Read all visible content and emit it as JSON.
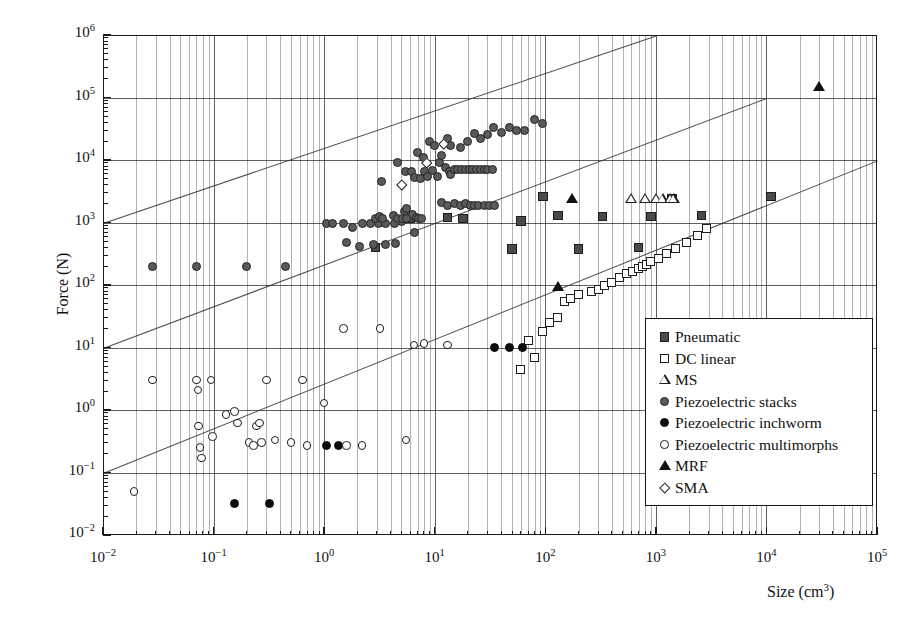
{
  "chart_data": {
    "type": "scatter",
    "title": "",
    "xlabel": "Size (cm3)",
    "ylabel": "Force (N)",
    "xscale": "log",
    "yscale": "log",
    "xlim": [
      0.01,
      100000
    ],
    "ylim": [
      0.01,
      1000000
    ],
    "grid": true,
    "legend_position": "bottom-right",
    "x_tick_labels": [
      "10-2",
      "10-1",
      "100",
      "101",
      "102",
      "103",
      "104",
      "105"
    ],
    "y_tick_labels": [
      "10-2",
      "10-1",
      "100",
      "101",
      "102",
      "103",
      "104",
      "105",
      "106"
    ],
    "x_tick_exponents": [
      "-2",
      "-1",
      "0",
      "1",
      "2",
      "3",
      "4",
      "5"
    ],
    "y_tick_exponents": [
      "-2",
      "-1",
      "0",
      "1",
      "2",
      "3",
      "4",
      "5",
      "6"
    ],
    "reference_lines": [
      {
        "name": "upper-diagonal",
        "slope": 0.666,
        "points": [
          [
            0.01,
            1000
          ],
          [
            1000,
            1000000
          ]
        ]
      },
      {
        "name": "middle-diagonal",
        "slope": 0.666,
        "points": [
          [
            0.01,
            10
          ],
          [
            10000,
            100000
          ]
        ]
      },
      {
        "name": "lower-diagonal",
        "slope": 0.666,
        "points": [
          [
            0.01,
            0.1
          ],
          [
            100000,
            10000
          ]
        ]
      }
    ],
    "series": [
      {
        "name": "Pneumatic",
        "marker": "square-filled",
        "color": "#4a4a4a",
        "points": [
          [
            2.9,
            400
          ],
          [
            6.0,
            1150
          ],
          [
            13.0,
            1200
          ],
          [
            18.0,
            1150
          ],
          [
            50.0,
            380
          ],
          [
            60.0,
            1050
          ],
          [
            95.0,
            2600
          ],
          [
            130.0,
            1300
          ],
          [
            200.0,
            380
          ],
          [
            330.0,
            1250
          ],
          [
            700.0,
            400
          ],
          [
            900.0,
            1250
          ],
          [
            1400.0,
            2400
          ],
          [
            2600.0,
            1300
          ],
          [
            11000.0,
            2600
          ]
        ]
      },
      {
        "name": "DC linear",
        "marker": "square-open",
        "color": "#ffffff",
        "points": [
          [
            60.0,
            4.5
          ],
          [
            70.0,
            13.0
          ],
          [
            80.0,
            7.0
          ],
          [
            95.0,
            18.0
          ],
          [
            110.0,
            25.0
          ],
          [
            130.0,
            30.0
          ],
          [
            150.0,
            55.0
          ],
          [
            170.0,
            60.0
          ],
          [
            200.0,
            70.0
          ],
          [
            260.0,
            80.0
          ],
          [
            300.0,
            85.0
          ],
          [
            340.0,
            100.0
          ],
          [
            400.0,
            110.0
          ],
          [
            470.0,
            130.0
          ],
          [
            540.0,
            150.0
          ],
          [
            620.0,
            165.0
          ],
          [
            700.0,
            185.0
          ],
          [
            760.0,
            200.0
          ],
          [
            820.0,
            210.0
          ],
          [
            900.0,
            240.0
          ],
          [
            1050.0,
            270.0
          ],
          [
            1250.0,
            320.0
          ],
          [
            1500.0,
            380.0
          ],
          [
            1900.0,
            480.0
          ],
          [
            2400.0,
            620.0
          ],
          [
            2900.0,
            800.0
          ]
        ]
      },
      {
        "name": "MS",
        "marker": "triangle-open",
        "color": "#ffffff",
        "points": [
          [
            600.0,
            2400
          ],
          [
            800.0,
            2400
          ],
          [
            1000.0,
            2400
          ],
          [
            1150.0,
            2400
          ],
          [
            1350.0,
            2400
          ],
          [
            1450.0,
            2400
          ]
        ]
      },
      {
        "name": "Piezoelectric stacks",
        "marker": "circle-grey",
        "color": "#5a5a5a",
        "points": [
          [
            0.028,
            200
          ],
          [
            0.07,
            200
          ],
          [
            0.2,
            200
          ],
          [
            0.45,
            200
          ],
          [
            1.05,
            950
          ],
          [
            1.2,
            950
          ],
          [
            1.5,
            950
          ],
          [
            1.8,
            830
          ],
          [
            2.2,
            950
          ],
          [
            2.6,
            950
          ],
          [
            3.1,
            950
          ],
          [
            3.6,
            950
          ],
          [
            4.3,
            950
          ],
          [
            5.0,
            1050
          ],
          [
            5.3,
            1500
          ],
          [
            5.6,
            1700
          ],
          [
            6.3,
            1350
          ],
          [
            6.5,
            700
          ],
          [
            2.9,
            1150
          ],
          [
            3.2,
            1250
          ],
          [
            3.4,
            1150
          ],
          [
            4.2,
            1300
          ],
          [
            4.6,
            1150
          ],
          [
            5.1,
            1150
          ],
          [
            5.5,
            1150
          ],
          [
            6.8,
            1200
          ],
          [
            7.2,
            1150
          ],
          [
            7.6,
            1150
          ],
          [
            3.3,
            4500
          ],
          [
            4.6,
            9000
          ],
          [
            5.4,
            6500
          ],
          [
            6.2,
            6500
          ],
          [
            6.5,
            5200
          ],
          [
            7.4,
            5000
          ],
          [
            8.1,
            6500
          ],
          [
            8.6,
            5500
          ],
          [
            9.5,
            6800
          ],
          [
            10.5,
            5500
          ],
          [
            11.0,
            9000
          ],
          [
            11.5,
            12000
          ],
          [
            12.5,
            7500
          ],
          [
            13.5,
            6500
          ],
          [
            14.0,
            5800
          ],
          [
            15.0,
            7000
          ],
          [
            16.0,
            7000
          ],
          [
            17.5,
            7000
          ],
          [
            19.0,
            7000
          ],
          [
            20.5,
            7000
          ],
          [
            22.0,
            7000
          ],
          [
            24.0,
            7000
          ],
          [
            26.0,
            7000
          ],
          [
            28.0,
            7000
          ],
          [
            30.0,
            7000
          ],
          [
            33.0,
            7000
          ],
          [
            9.0,
            20000
          ],
          [
            10.0,
            17000
          ],
          [
            13.0,
            22000
          ],
          [
            14.0,
            17000
          ],
          [
            17.0,
            16000
          ],
          [
            20.0,
            20000
          ],
          [
            23.0,
            27000
          ],
          [
            26.0,
            22000
          ],
          [
            30.0,
            26000
          ],
          [
            34.0,
            33000
          ],
          [
            40.0,
            28000
          ],
          [
            47.0,
            33000
          ],
          [
            55.0,
            30000
          ],
          [
            65.0,
            30000
          ],
          [
            80.0,
            45000
          ],
          [
            95.0,
            38000
          ],
          [
            7.0,
            13000
          ],
          [
            8.0,
            11000
          ],
          [
            11.5,
            2100
          ],
          [
            13.0,
            1900
          ],
          [
            15.0,
            2000
          ],
          [
            17.0,
            1900
          ],
          [
            19.0,
            2000
          ],
          [
            21.0,
            1900
          ],
          [
            23.0,
            1900
          ],
          [
            25.0,
            1900
          ],
          [
            28.0,
            1900
          ],
          [
            31.0,
            1900
          ],
          [
            35.0,
            1900
          ],
          [
            1.6,
            470
          ],
          [
            2.1,
            420
          ],
          [
            2.8,
            450
          ],
          [
            3.6,
            450
          ],
          [
            4.4,
            460
          ]
        ]
      },
      {
        "name": "Piezoelectric inchworm",
        "marker": "circle-black",
        "color": "#0c0c0c",
        "points": [
          [
            0.155,
            0.032
          ],
          [
            0.32,
            0.032
          ],
          [
            1.05,
            0.27
          ],
          [
            1.35,
            0.27
          ],
          [
            35.0,
            10.0
          ],
          [
            47.0,
            10.0
          ],
          [
            62.0,
            10.0
          ]
        ]
      },
      {
        "name": "Piezoelectric multimorphs",
        "marker": "circle-open",
        "color": "#ffffff",
        "points": [
          [
            0.019,
            0.05
          ],
          [
            0.028,
            3.0
          ],
          [
            0.07,
            3.0
          ],
          [
            0.072,
            2.1
          ],
          [
            0.073,
            0.55
          ],
          [
            0.075,
            0.25
          ],
          [
            0.078,
            0.17
          ],
          [
            0.095,
            3.0
          ],
          [
            0.098,
            0.38
          ],
          [
            0.13,
            0.85
          ],
          [
            0.155,
            0.95
          ],
          [
            0.165,
            0.62
          ],
          [
            0.21,
            0.3
          ],
          [
            0.23,
            0.27
          ],
          [
            0.245,
            0.55
          ],
          [
            0.26,
            0.62
          ],
          [
            0.27,
            0.3
          ],
          [
            0.3,
            3.0
          ],
          [
            0.36,
            0.33
          ],
          [
            0.5,
            0.3
          ],
          [
            0.64,
            3.0
          ],
          [
            0.7,
            0.27
          ],
          [
            1.0,
            1.3
          ],
          [
            1.5,
            20.0
          ],
          [
            1.6,
            0.27
          ],
          [
            2.2,
            0.27
          ],
          [
            3.2,
            20.0
          ],
          [
            5.5,
            0.33
          ],
          [
            8.0,
            11.5
          ],
          [
            13.0,
            11.0
          ],
          [
            6.5,
            11.0
          ]
        ]
      },
      {
        "name": "MRF",
        "marker": "triangle-filled",
        "color": "#111111",
        "points": [
          [
            130.0,
            95.0
          ],
          [
            175.0,
            2400
          ],
          [
            30000.0,
            150000
          ]
        ]
      },
      {
        "name": "SMA",
        "marker": "diamond-open",
        "color": "#ffffff",
        "points": [
          [
            5.0,
            4000
          ],
          [
            8.5,
            9000
          ],
          [
            12.0,
            18000
          ]
        ]
      }
    ]
  },
  "legend": {
    "entries": [
      {
        "label": "Pneumatic",
        "marker": "square-filled"
      },
      {
        "label": "DC linear",
        "marker": "square-open"
      },
      {
        "label": "MS",
        "marker": "triangle-open"
      },
      {
        "label": "Piezoelectric stacks",
        "marker": "circle-grey"
      },
      {
        "label": "Piezoelectric inchworm",
        "marker": "circle-black"
      },
      {
        "label": "Piezoelectric multimorphs",
        "marker": "circle-open"
      },
      {
        "label": "MRF",
        "marker": "triangle-filled"
      },
      {
        "label": "SMA",
        "marker": "diamond-open"
      }
    ]
  },
  "axes": {
    "x_title_text": "Size (cm",
    "x_title_sup": "3",
    "x_title_tail": ")",
    "y_title": "Force (N)"
  }
}
